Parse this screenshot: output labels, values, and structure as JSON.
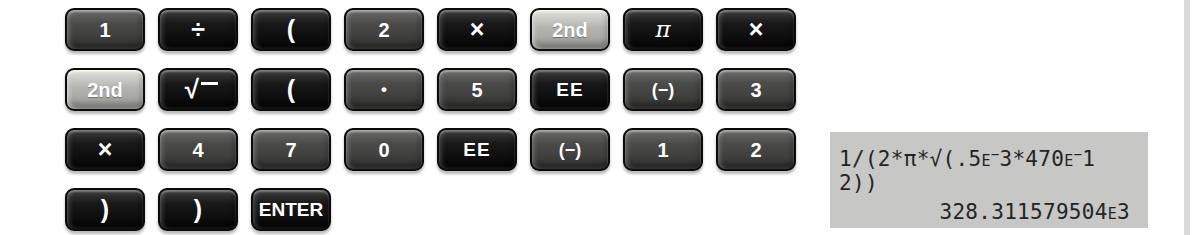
{
  "colors": {
    "page_bg": "#ffffff",
    "key_gray": "#4a4a48",
    "key_black": "#141414",
    "key_light": "#b4b4b0",
    "key_text": "#ffffff",
    "display_bg": "#c7c7c5",
    "display_text": "#242424",
    "edge_strip": "#d9d9d9"
  },
  "keypad": {
    "rows": [
      {
        "keys": [
          {
            "name": "key-1",
            "label": "1",
            "style": "gray",
            "kind": "digit"
          },
          {
            "name": "key-divide",
            "label": "÷",
            "style": "black",
            "kind": "sym"
          },
          {
            "name": "key-open-paren",
            "label": "(",
            "style": "black",
            "kind": "sym"
          },
          {
            "name": "key-2",
            "label": "2",
            "style": "gray",
            "kind": "digit"
          },
          {
            "name": "key-multiply",
            "label": "×",
            "style": "black",
            "kind": "sym"
          },
          {
            "name": "key-2nd",
            "label": "2nd",
            "style": "light",
            "kind": "digit"
          },
          {
            "name": "key-pi",
            "label": "π",
            "style": "black",
            "kind": "pi"
          },
          {
            "name": "key-multiply",
            "label": "×",
            "style": "black",
            "kind": "sym"
          }
        ]
      },
      {
        "keys": [
          {
            "name": "key-2nd",
            "label": "2nd",
            "style": "light",
            "kind": "digit"
          },
          {
            "name": "key-sqrt",
            "label": "√",
            "style": "black",
            "kind": "sqrt"
          },
          {
            "name": "key-open-paren",
            "label": "(",
            "style": "black",
            "kind": "sym"
          },
          {
            "name": "key-decimal-point",
            "label": "•",
            "style": "gray",
            "kind": "dot"
          },
          {
            "name": "key-5",
            "label": "5",
            "style": "gray",
            "kind": "digit"
          },
          {
            "name": "key-ee",
            "label": "EE",
            "style": "black",
            "kind": "ee"
          },
          {
            "name": "key-negate",
            "label": "(−)",
            "style": "gray",
            "kind": "neg"
          },
          {
            "name": "key-3",
            "label": "3",
            "style": "gray",
            "kind": "digit"
          }
        ]
      },
      {
        "keys": [
          {
            "name": "key-multiply",
            "label": "×",
            "style": "black",
            "kind": "sym"
          },
          {
            "name": "key-4",
            "label": "4",
            "style": "gray",
            "kind": "digit"
          },
          {
            "name": "key-7",
            "label": "7",
            "style": "gray",
            "kind": "digit"
          },
          {
            "name": "key-0",
            "label": "0",
            "style": "gray",
            "kind": "digit"
          },
          {
            "name": "key-ee",
            "label": "EE",
            "style": "black",
            "kind": "ee"
          },
          {
            "name": "key-negate",
            "label": "(−)",
            "style": "gray",
            "kind": "neg"
          },
          {
            "name": "key-1",
            "label": "1",
            "style": "gray",
            "kind": "digit"
          },
          {
            "name": "key-2",
            "label": "2",
            "style": "gray",
            "kind": "digit"
          }
        ]
      },
      {
        "keys": [
          {
            "name": "key-close-paren",
            "label": ")",
            "style": "black",
            "kind": "sym"
          },
          {
            "name": "key-close-paren",
            "label": ")",
            "style": "black",
            "kind": "sym"
          },
          {
            "name": "key-enter",
            "label": "ENTER",
            "style": "black",
            "kind": "enter"
          }
        ]
      }
    ]
  },
  "display": {
    "lines": [
      {
        "align": "left",
        "text": "1/(2*π*√(.5E−3*470E−1",
        "tokens": [
          {
            "t": "1/(2*π*√(.5"
          },
          {
            "t": "E",
            "k": "exp"
          },
          {
            "t": "−",
            "k": "sup"
          },
          {
            "t": "3*470"
          },
          {
            "t": "E",
            "k": "exp"
          },
          {
            "t": "−",
            "k": "sup"
          },
          {
            "t": "1"
          }
        ]
      },
      {
        "align": "left",
        "text": "2))",
        "tokens": [
          {
            "t": "2))"
          }
        ]
      },
      {
        "align": "right",
        "text": "328.311579504E3",
        "tokens": [
          {
            "t": "328.311579504"
          },
          {
            "t": "E",
            "k": "exp"
          },
          {
            "t": "3"
          }
        ]
      }
    ]
  }
}
